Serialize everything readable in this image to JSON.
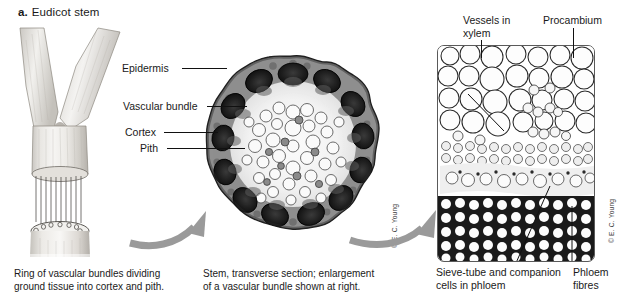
{
  "figure": {
    "label": "a.",
    "title": "Eudicot stem"
  },
  "cross_section_labels": [
    {
      "id": "epidermis",
      "text": "Epidermis"
    },
    {
      "id": "vascular-bundle",
      "text": "Vascular bundle"
    },
    {
      "id": "cortex",
      "text": "Cortex"
    },
    {
      "id": "pith",
      "text": "Pith"
    }
  ],
  "bundle_labels": {
    "vessels_line1": "Vessels in",
    "vessels_line2": "xylem",
    "procambium": "Procambium",
    "sieve_tube_line1": "Sieve-tube and companion",
    "sieve_tube_line2": "cells in phloem",
    "phloem_fibres_line1": "Phloem",
    "phloem_fibres_line2": "fibres"
  },
  "captions": {
    "stem_line1": "Ring of vascular bundles dividing",
    "stem_line2": "ground tissue into cortex and pith.",
    "cross_section_line1": "Stem, transverse section; enlargement",
    "cross_section_line2": "of a vascular bundle shown at right."
  },
  "credits": {
    "cross_section": "© E. C. Young",
    "bundle": "© E. C. Young"
  },
  "icons": {
    "arrow_stem_to_section": "curved-arrow-icon",
    "arrow_section_to_bundle": "curved-arrow-icon"
  },
  "colors": {
    "background": "#ffffff",
    "text": "#1a1a1a",
    "leader_line": "#111111",
    "arrow": "#9a9a9a",
    "panel_border": "#5a5a5a"
  }
}
